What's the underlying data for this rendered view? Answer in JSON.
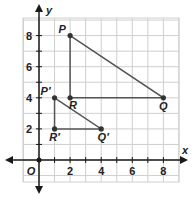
{
  "diagram": {
    "type": "coordinate-plane",
    "axes": {
      "x_label": "x",
      "y_label": "y",
      "origin_label": "O",
      "x_ticks": [
        {
          "value": 2,
          "label": "2"
        },
        {
          "value": 4,
          "label": "4"
        },
        {
          "value": 6,
          "label": "6"
        },
        {
          "value": 8,
          "label": "8"
        }
      ],
      "y_ticks": [
        {
          "value": 2,
          "label": "2"
        },
        {
          "value": 4,
          "label": "4"
        },
        {
          "value": 6,
          "label": "6"
        },
        {
          "value": 8,
          "label": "8"
        }
      ],
      "x_range": [
        -1,
        9
      ],
      "y_range": [
        -1,
        9.5
      ]
    },
    "triangles": [
      {
        "name": "PQR",
        "vertices": [
          {
            "label": "P",
            "x": 2,
            "y": 8
          },
          {
            "label": "Q",
            "x": 8,
            "y": 4
          },
          {
            "label": "R",
            "x": 2,
            "y": 4
          }
        ]
      },
      {
        "name": "P'Q'R'",
        "vertices": [
          {
            "label": "P′",
            "x": 1,
            "y": 4
          },
          {
            "label": "Q′",
            "x": 4,
            "y": 2
          },
          {
            "label": "R′",
            "x": 1,
            "y": 2
          }
        ]
      }
    ],
    "colors": {
      "grid": "#cfcfcf",
      "axis": "#1a1a1a",
      "triangle_stroke": "#555555",
      "point": "#333333"
    }
  }
}
